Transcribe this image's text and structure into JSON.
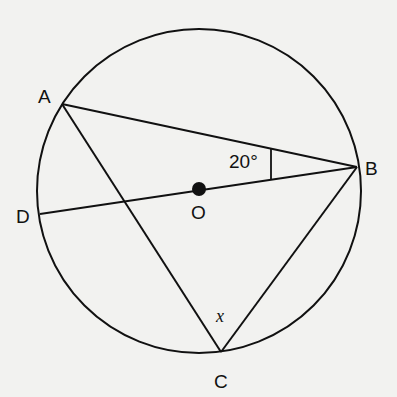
{
  "diagram": {
    "type": "circle-geometry",
    "points": {
      "A": {
        "label": "A",
        "x": 62,
        "y": 104
      },
      "B": {
        "label": "B",
        "x": 357,
        "y": 167
      },
      "C": {
        "label": "C",
        "x": 221,
        "y": 352
      },
      "D": {
        "label": "D",
        "x": 40,
        "y": 214
      },
      "O": {
        "label": "O",
        "x": 199,
        "y": 189
      }
    },
    "circle": {
      "cx": 199,
      "cy": 191,
      "r": 162
    },
    "segments": [
      "AB",
      "AC",
      "BC",
      "DB"
    ],
    "annotations": {
      "angle_ABD": "20°",
      "angle_ACB": "x"
    },
    "colors": {
      "ink": "#111111",
      "background": "#f2f2f0"
    }
  }
}
